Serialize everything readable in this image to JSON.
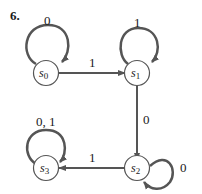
{
  "problem_number": "6.",
  "states": [
    {
      "id": "s0",
      "base": "s",
      "sub": "0"
    },
    {
      "id": "s1",
      "base": "s",
      "sub": "1"
    },
    {
      "id": "s2",
      "base": "s",
      "sub": "2"
    },
    {
      "id": "s3",
      "base": "s",
      "sub": "3"
    }
  ],
  "transitions": [
    {
      "from": "s0",
      "to": "s0",
      "label": "0"
    },
    {
      "from": "s0",
      "to": "s1",
      "label": "1"
    },
    {
      "from": "s1",
      "to": "s1",
      "label": "1"
    },
    {
      "from": "s1",
      "to": "s2",
      "label": "0"
    },
    {
      "from": "s2",
      "to": "s2",
      "label": "0"
    },
    {
      "from": "s2",
      "to": "s3",
      "label": "1"
    },
    {
      "from": "s3",
      "to": "s3",
      "label": "0, 1"
    }
  ],
  "colors": {
    "line": "#555555",
    "text": "#1a1a1a",
    "node_stroke": "#555555"
  }
}
